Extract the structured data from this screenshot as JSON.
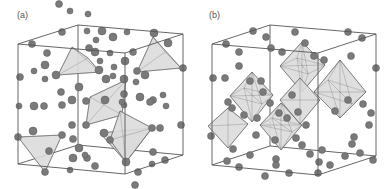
{
  "figure": {
    "panels": [
      {
        "label": "(a)",
        "polyhedron_type": "tetrahedra",
        "box": {
          "tlf": [
            18,
            44
          ],
          "trf": [
            125,
            53
          ],
          "trb": [
            183,
            34
          ],
          "tlb": [
            78,
            25
          ],
          "blf": [
            18,
            164
          ],
          "brf": [
            125,
            174
          ],
          "brb": [
            183,
            155
          ],
          "blb": [
            78,
            145
          ]
        },
        "polyhedra": [
          [
            [
              72,
              47
            ],
            [
              88,
              58
            ],
            [
              58,
              75
            ],
            [
              100,
              72
            ]
          ],
          [
            [
              153,
              37
            ],
            [
              181,
              68
            ],
            [
              137,
              72
            ],
            [
              165,
              52
            ]
          ],
          [
            [
              90,
              97
            ],
            [
              126,
              80
            ],
            [
              86,
              125
            ],
            [
              122,
              115
            ]
          ],
          [
            [
              100,
              133
            ],
            [
              152,
              128
            ],
            [
              126,
              162
            ]
          ],
          [
            [
              18,
              137
            ],
            [
              62,
              135
            ],
            [
              45,
              172
            ]
          ],
          [
            [
              120,
              111
            ],
            [
              152,
              128
            ],
            [
              126,
              162
            ],
            [
              110,
              140
            ]
          ]
        ],
        "atoms": [
          [
            20,
            77,
            3.5
          ],
          [
            32,
            44,
            3.5
          ],
          [
            47,
            53,
            3.5
          ],
          [
            62,
            32,
            3.5
          ],
          [
            87,
            31,
            3
          ],
          [
            102,
            31,
            4
          ],
          [
            113,
            37,
            4
          ],
          [
            127,
            32,
            3
          ],
          [
            154,
            33,
            4
          ],
          [
            168,
            43,
            4
          ],
          [
            133,
            52,
            3.5
          ],
          [
            89,
            48,
            3.5
          ],
          [
            95,
            52,
            4
          ],
          [
            110,
            53,
            3
          ],
          [
            96,
            40,
            3
          ],
          [
            100,
            61,
            3
          ],
          [
            45,
            65,
            4
          ],
          [
            34,
            71,
            3
          ],
          [
            45,
            79,
            3
          ],
          [
            56,
            75,
            4
          ],
          [
            99,
            70,
            4
          ],
          [
            114,
            67,
            3
          ],
          [
            125,
            61,
            4
          ],
          [
            137,
            71,
            3.5
          ],
          [
            145,
            75,
            4
          ],
          [
            183,
            68,
            3.5
          ],
          [
            124,
            79,
            4
          ],
          [
            136,
            82,
            3
          ],
          [
            113,
            76,
            3
          ],
          [
            106,
            79,
            4
          ],
          [
            61,
            92,
            3.5
          ],
          [
            79,
            87,
            4
          ],
          [
            72,
            100,
            4
          ],
          [
            86,
            101,
            3.5
          ],
          [
            105,
            100,
            4
          ],
          [
            124,
            94,
            3.5
          ],
          [
            124,
            105,
            3
          ],
          [
            140,
            97,
            4
          ],
          [
            163,
            95,
            3
          ],
          [
            153,
            100,
            3.5
          ],
          [
            166,
            106,
            3
          ],
          [
            181,
            125,
            3.5
          ],
          [
            19,
            106,
            3
          ],
          [
            34,
            106,
            4
          ],
          [
            44,
            106,
            3.5
          ],
          [
            62,
            105,
            3.5
          ],
          [
            72,
            125,
            3.5
          ],
          [
            86,
            125,
            3.5
          ],
          [
            104,
            133,
            4
          ],
          [
            122,
            102,
            3
          ],
          [
            110,
            140,
            3.5
          ],
          [
            126,
            162,
            4
          ],
          [
            18,
            137,
            3.5
          ],
          [
            33,
            131,
            4
          ],
          [
            62,
            135,
            3.5
          ],
          [
            49,
            151,
            3.5
          ],
          [
            45,
            172,
            3.5
          ],
          [
            73,
            139,
            3.5
          ],
          [
            79,
            148,
            4
          ],
          [
            73,
            158,
            4
          ],
          [
            87,
            158,
            3.5
          ],
          [
            70,
            170,
            3
          ],
          [
            95,
            166,
            3.5
          ],
          [
            85,
            155,
            3
          ],
          [
            138,
            172,
            3.5
          ],
          [
            152,
            164,
            3
          ],
          [
            165,
            160,
            3.5
          ],
          [
            153,
            152,
            3.5
          ],
          [
            152,
            128,
            3.5
          ],
          [
            150,
            102,
            3.5
          ],
          [
            160,
            128,
            3.5
          ],
          [
            135,
            185,
            3.5
          ],
          [
            59,
            4,
            3.5
          ],
          [
            70,
            11,
            3
          ],
          [
            88,
            14,
            3
          ]
        ]
      },
      {
        "label": "(b)",
        "polyhedron_type": "octahedra",
        "box": {
          "tlf": [
            212,
            44
          ],
          "trf": [
            318,
            53
          ],
          "trb": [
            376,
            34
          ],
          "tlb": [
            270,
            25
          ],
          "blf": [
            212,
            165
          ],
          "brf": [
            318,
            175
          ],
          "brb": [
            376,
            156
          ],
          "blb": [
            270,
            146
          ]
        },
        "polyhedra": [
          [
            [
              302,
              42
            ],
            [
              325,
              65
            ],
            [
              302,
              92
            ],
            [
              280,
              66
            ],
            [
              297,
              58
            ],
            [
              308,
              74
            ]
          ],
          [
            [
              340,
              60
            ],
            [
              366,
              92
            ],
            [
              340,
              118
            ],
            [
              314,
              92
            ],
            [
              328,
              80
            ],
            [
              352,
              104
            ]
          ],
          [
            [
              252,
              72
            ],
            [
              273,
              95
            ],
            [
              252,
              122
            ],
            [
              230,
              96
            ],
            [
              244,
              88
            ],
            [
              262,
              104
            ]
          ],
          [
            [
              281,
              103
            ],
            [
              302,
              125
            ],
            [
              281,
              150
            ],
            [
              260,
              125
            ],
            [
              272,
              118
            ],
            [
              292,
              132
            ]
          ],
          [
            [
              300,
              78
            ],
            [
              320,
              100
            ],
            [
              300,
              124
            ],
            [
              280,
              100
            ]
          ],
          [
            [
              228,
              108
            ],
            [
              248,
              124
            ],
            [
              228,
              148
            ],
            [
              208,
              126
            ]
          ]
        ],
        "atoms": [
          [
            226,
            44,
            3.5
          ],
          [
            239,
            52,
            3.5
          ],
          [
            253,
            31,
            3.5
          ],
          [
            266,
            37,
            3.5
          ],
          [
            295,
            32,
            3.5
          ],
          [
            348,
            32,
            3.5
          ],
          [
            362,
            38,
            3.5
          ],
          [
            239,
            66,
            3.5
          ],
          [
            225,
            78,
            3.5
          ],
          [
            271,
            48,
            3.5
          ],
          [
            282,
            52,
            3.5
          ],
          [
            305,
            43,
            3.5
          ],
          [
            314,
            56,
            3.5
          ],
          [
            324,
            60,
            3.5
          ],
          [
            351,
            56,
            3.5
          ],
          [
            376,
            68,
            3.5
          ],
          [
            213,
            78,
            3.5
          ],
          [
            250,
            81,
            3.5
          ],
          [
            261,
            81,
            3.5
          ],
          [
            263,
            92,
            3.5
          ],
          [
            270,
            103,
            3.5
          ],
          [
            292,
            95,
            3.5
          ],
          [
            298,
            112,
            3.5
          ],
          [
            335,
            111,
            3.5
          ],
          [
            354,
            137,
            3.5
          ],
          [
            369,
            125,
            3.5
          ],
          [
            371,
            113,
            3.5
          ],
          [
            228,
            102,
            3.5
          ],
          [
            232,
            108,
            3.5
          ],
          [
            244,
            115,
            3.5
          ],
          [
            257,
            118,
            3.5
          ],
          [
            279,
            113,
            3.5
          ],
          [
            287,
            118,
            3.5
          ],
          [
            306,
            125,
            3.5
          ],
          [
            348,
            100,
            3.5
          ],
          [
            363,
            104,
            3.5
          ],
          [
            211,
            136,
            3.5
          ],
          [
            233,
            149,
            3.5
          ],
          [
            250,
            155,
            3.5
          ],
          [
            256,
            135,
            3.5
          ],
          [
            275,
            140,
            3.5
          ],
          [
            276,
            159,
            3.5
          ],
          [
            296,
            138,
            3.5
          ],
          [
            302,
            145,
            3.5
          ],
          [
            322,
            150,
            3.5
          ],
          [
            310,
            154,
            3.5
          ],
          [
            319,
            162,
            3.5
          ],
          [
            227,
            161,
            3.5
          ],
          [
            239,
            167,
            3.5
          ],
          [
            276,
            165,
            3.5
          ],
          [
            330,
            165,
            3.5
          ],
          [
            360,
            153,
            3.5
          ],
          [
            373,
            160,
            3.5
          ],
          [
            345,
            156,
            3.5
          ],
          [
            289,
            173,
            3.5
          ],
          [
            318,
            173,
            3.5
          ],
          [
            352,
            144,
            3.5
          ],
          [
            265,
            176,
            3.5
          ]
        ]
      }
    ],
    "colors": {
      "atom_fill": "#7a7a7a",
      "atom_stroke": "#5a5a5a",
      "poly_fill": "#dcdcdc",
      "poly_stroke": "#666666",
      "box_stroke": "#555555",
      "label": "#555555"
    }
  }
}
